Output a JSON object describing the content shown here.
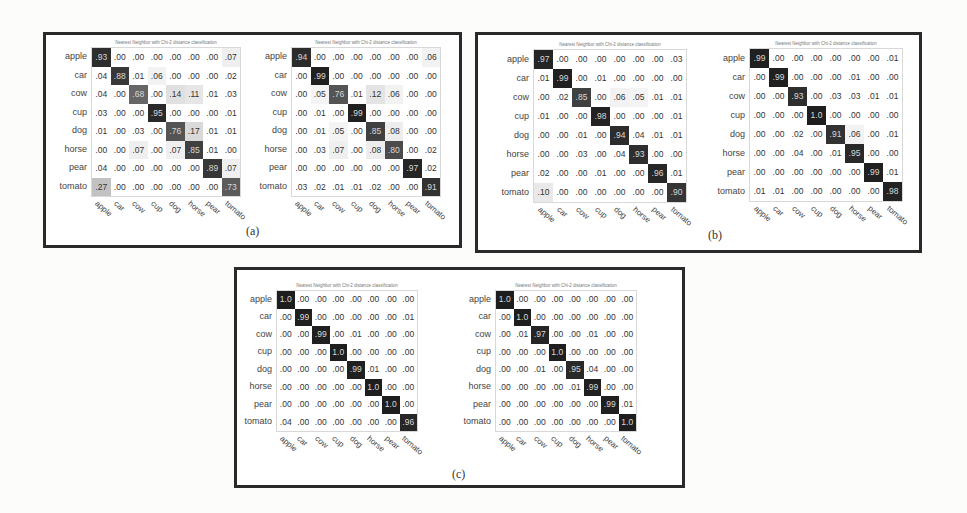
{
  "chart_data": {
    "type": "heatmap",
    "classes": [
      "apple",
      "car",
      "cow",
      "cup",
      "dog",
      "horse",
      "pear",
      "tomato"
    ],
    "matrix_title": "Nearest Neighbor with Chi-2 distance classification",
    "panels": [
      {
        "caption": "(a)",
        "matrices": [
          {
            "values": [
              [
                ".93",
                ".00",
                ".00",
                ".00",
                ".00",
                ".00",
                ".00",
                ".07"
              ],
              [
                ".04",
                ".88",
                ".01",
                ".06",
                ".00",
                ".00",
                ".00",
                ".02"
              ],
              [
                ".04",
                ".00",
                ".68",
                ".00",
                ".14",
                ".11",
                ".01",
                ".03"
              ],
              [
                ".03",
                ".00",
                ".00",
                ".95",
                ".00",
                ".00",
                ".00",
                ".01"
              ],
              [
                ".01",
                ".00",
                ".03",
                ".00",
                ".76",
                ".17",
                ".01",
                ".01"
              ],
              [
                ".00",
                ".00",
                ".07",
                ".00",
                ".07",
                ".85",
                ".01",
                ".00"
              ],
              [
                ".04",
                ".00",
                ".00",
                ".00",
                ".00",
                ".00",
                ".89",
                ".07"
              ],
              [
                ".27",
                ".00",
                ".00",
                ".00",
                ".00",
                ".00",
                ".00",
                ".73"
              ]
            ]
          },
          {
            "values": [
              [
                ".94",
                ".00",
                ".00",
                ".00",
                ".00",
                ".00",
                ".00",
                ".06"
              ],
              [
                ".00",
                ".99",
                ".00",
                ".00",
                ".00",
                ".00",
                ".00",
                ".00"
              ],
              [
                ".00",
                ".05",
                ".76",
                ".01",
                ".12",
                ".06",
                ".00",
                ".00"
              ],
              [
                ".00",
                ".01",
                ".00",
                ".99",
                ".00",
                ".00",
                ".00",
                ".00"
              ],
              [
                ".00",
                ".01",
                ".05",
                ".00",
                ".85",
                ".08",
                ".00",
                ".00"
              ],
              [
                ".00",
                ".03",
                ".07",
                ".00",
                ".08",
                ".80",
                ".00",
                ".02"
              ],
              [
                ".00",
                ".00",
                ".00",
                ".00",
                ".00",
                ".00",
                ".97",
                ".02"
              ],
              [
                ".03",
                ".02",
                ".01",
                ".01",
                ".02",
                ".00",
                ".00",
                ".91"
              ]
            ]
          }
        ]
      },
      {
        "caption": "(b)",
        "matrices": [
          {
            "values": [
              [
                ".97",
                ".00",
                ".00",
                ".00",
                ".00",
                ".00",
                ".00",
                ".03"
              ],
              [
                ".01",
                ".99",
                ".00",
                ".01",
                ".00",
                ".00",
                ".00",
                ".00"
              ],
              [
                ".00",
                ".02",
                ".85",
                ".00",
                ".06",
                ".05",
                ".01",
                ".01"
              ],
              [
                ".01",
                ".00",
                ".00",
                ".98",
                ".00",
                ".00",
                ".00",
                ".01"
              ],
              [
                ".00",
                ".00",
                ".01",
                ".00",
                ".94",
                ".04",
                ".01",
                ".01"
              ],
              [
                ".00",
                ".00",
                ".03",
                ".00",
                ".04",
                ".93",
                ".00",
                ".00"
              ],
              [
                ".02",
                ".00",
                ".00",
                ".01",
                ".00",
                ".00",
                ".96",
                ".01"
              ],
              [
                ".10",
                ".00",
                ".00",
                ".00",
                ".00",
                ".00",
                ".00",
                ".90"
              ]
            ]
          },
          {
            "values": [
              [
                ".99",
                ".00",
                ".00",
                ".00",
                ".00",
                ".00",
                ".00",
                ".01"
              ],
              [
                ".00",
                ".99",
                ".00",
                ".00",
                ".00",
                ".01",
                ".00",
                ".00"
              ],
              [
                ".00",
                ".00",
                ".93",
                ".00",
                ".03",
                ".03",
                ".01",
                ".01"
              ],
              [
                ".00",
                ".00",
                ".00",
                "1.0",
                ".00",
                ".00",
                ".00",
                ".00"
              ],
              [
                ".00",
                ".00",
                ".02",
                ".00",
                ".91",
                ".06",
                ".00",
                ".01"
              ],
              [
                ".00",
                ".00",
                ".04",
                ".00",
                ".01",
                ".95",
                ".00",
                ".00"
              ],
              [
                ".00",
                ".00",
                ".00",
                ".00",
                ".00",
                ".00",
                ".99",
                ".01"
              ],
              [
                ".01",
                ".01",
                ".00",
                ".00",
                ".00",
                ".00",
                ".00",
                ".98"
              ]
            ]
          }
        ]
      },
      {
        "caption": "(c)",
        "matrices": [
          {
            "values": [
              [
                "1.0",
                ".00",
                ".00",
                ".00",
                ".00",
                ".00",
                ".00",
                ".00"
              ],
              [
                ".00",
                ".99",
                ".00",
                ".00",
                ".00",
                ".00",
                ".00",
                ".01"
              ],
              [
                ".00",
                ".00",
                ".99",
                ".00",
                ".01",
                ".00",
                ".00",
                ".00"
              ],
              [
                ".00",
                ".00",
                ".00",
                "1.0",
                ".00",
                ".00",
                ".00",
                ".00"
              ],
              [
                ".00",
                ".00",
                ".00",
                ".00",
                ".99",
                ".01",
                ".00",
                ".00"
              ],
              [
                ".00",
                ".00",
                ".00",
                ".00",
                ".00",
                "1.0",
                ".00",
                ".00"
              ],
              [
                ".00",
                ".00",
                ".00",
                ".00",
                ".00",
                ".00",
                "1.0",
                ".00"
              ],
              [
                ".04",
                ".00",
                ".00",
                ".00",
                ".00",
                ".00",
                ".00",
                ".96"
              ]
            ]
          },
          {
            "values": [
              [
                "1.0",
                ".00",
                ".00",
                ".00",
                ".00",
                ".00",
                ".00",
                ".00"
              ],
              [
                ".00",
                "1.0",
                ".00",
                ".00",
                ".00",
                ".00",
                ".00",
                ".00"
              ],
              [
                ".00",
                ".01",
                ".97",
                ".00",
                ".00",
                ".01",
                ".00",
                ".00"
              ],
              [
                ".00",
                ".00",
                ".00",
                "1.0",
                ".00",
                ".00",
                ".00",
                ".00"
              ],
              [
                ".00",
                ".00",
                ".01",
                ".00",
                ".95",
                ".04",
                ".00",
                ".00"
              ],
              [
                ".00",
                ".00",
                ".00",
                ".00",
                ".01",
                ".99",
                ".00",
                ".00"
              ],
              [
                ".00",
                ".00",
                ".00",
                ".00",
                ".00",
                ".00",
                ".99",
                ".01"
              ],
              [
                ".00",
                ".00",
                ".00",
                ".00",
                ".00",
                ".00",
                ".00",
                "1.0"
              ]
            ]
          }
        ]
      }
    ]
  },
  "layout": {
    "panels": [
      {
        "x": 43,
        "y": 32,
        "w": 419,
        "h": 216,
        "cap_x": 246,
        "cap_y": 224,
        "m": [
          {
            "x": 92,
            "y": 48,
            "cs": 18.5,
            "ch": 18.5
          },
          {
            "x": 292,
            "y": 48,
            "cs": 18.5,
            "ch": 18.5
          }
        ]
      },
      {
        "x": 475,
        "y": 32,
        "w": 447,
        "h": 221,
        "cap_x": 708,
        "cap_y": 228,
        "m": [
          {
            "x": 534,
            "y": 50,
            "cs": 19,
            "ch": 19
          },
          {
            "x": 750,
            "y": 49,
            "cs": 19,
            "ch": 19
          }
        ]
      },
      {
        "x": 234,
        "y": 267,
        "w": 451,
        "h": 221,
        "cap_x": 452,
        "cap_y": 467,
        "m": [
          {
            "x": 277,
            "y": 291,
            "cs": 17.5,
            "ch": 17.5
          },
          {
            "x": 496,
            "y": 291,
            "cs": 17.5,
            "ch": 17.5
          }
        ]
      }
    ]
  }
}
